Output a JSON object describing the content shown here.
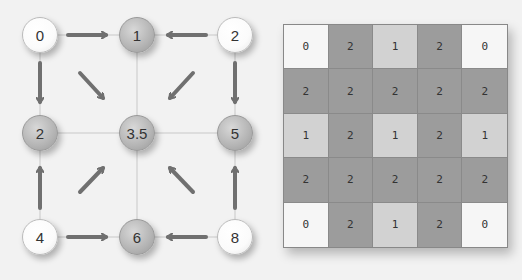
{
  "diagram": {
    "nodes": [
      {
        "id": "n00",
        "label": "0",
        "x": 40,
        "y": 35,
        "style": "white"
      },
      {
        "id": "n01",
        "label": "1",
        "x": 137,
        "y": 35,
        "style": "gray"
      },
      {
        "id": "n02",
        "label": "2",
        "x": 235,
        "y": 35,
        "style": "white"
      },
      {
        "id": "n10",
        "label": "2",
        "x": 40,
        "y": 133,
        "style": "gray"
      },
      {
        "id": "n11",
        "label": "3.5",
        "x": 137,
        "y": 133,
        "style": "gray"
      },
      {
        "id": "n12",
        "label": "5",
        "x": 235,
        "y": 133,
        "style": "gray"
      },
      {
        "id": "n20",
        "label": "4",
        "x": 40,
        "y": 237,
        "style": "white"
      },
      {
        "id": "n21",
        "label": "6",
        "x": 137,
        "y": 237,
        "style": "gray"
      },
      {
        "id": "n22",
        "label": "8",
        "x": 235,
        "y": 237,
        "style": "white"
      }
    ],
    "arrows": [
      {
        "from": [
          68,
          35
        ],
        "to": [
          106,
          35
        ]
      },
      {
        "from": [
          206,
          35
        ],
        "to": [
          168,
          35
        ]
      },
      {
        "from": [
          40,
          63
        ],
        "to": [
          40,
          102
        ]
      },
      {
        "from": [
          235,
          63
        ],
        "to": [
          235,
          102
        ]
      },
      {
        "from": [
          80,
          73
        ],
        "to": [
          103,
          98
        ]
      },
      {
        "from": [
          193,
          73
        ],
        "to": [
          170,
          98
        ]
      },
      {
        "from": [
          40,
          208
        ],
        "to": [
          40,
          168
        ]
      },
      {
        "from": [
          235,
          208
        ],
        "to": [
          235,
          168
        ]
      },
      {
        "from": [
          80,
          192
        ],
        "to": [
          103,
          168
        ]
      },
      {
        "from": [
          193,
          192
        ],
        "to": [
          170,
          168
        ]
      },
      {
        "from": [
          68,
          237
        ],
        "to": [
          106,
          237
        ]
      },
      {
        "from": [
          206,
          237
        ],
        "to": [
          168,
          237
        ]
      }
    ],
    "colors": {
      "arrow": "#707070",
      "line": "#c8c8c8"
    }
  },
  "grid": {
    "rows": [
      [
        "0",
        "2",
        "1",
        "2",
        "0"
      ],
      [
        "2",
        "2",
        "2",
        "2",
        "2"
      ],
      [
        "1",
        "2",
        "1",
        "2",
        "1"
      ],
      [
        "2",
        "2",
        "2",
        "2",
        "2"
      ],
      [
        "0",
        "2",
        "1",
        "2",
        "0"
      ]
    ],
    "colors": {
      "0": "#f6f6f6",
      "1": "#d2d2d2",
      "2": "#9c9c9c"
    }
  }
}
